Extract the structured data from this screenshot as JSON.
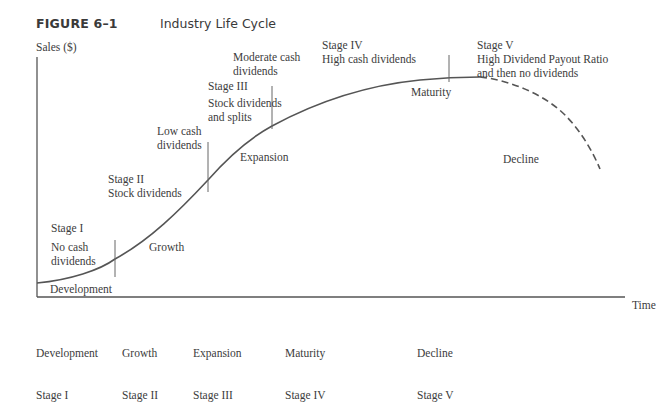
{
  "figure": {
    "number": "FIGURE 6–1",
    "title": "Industry Life Cycle"
  },
  "axes": {
    "y_label": "Sales ($)",
    "x_label": "Time"
  },
  "annotations": {
    "stage1": {
      "heading": "Stage I",
      "text": "No cash\ndividends"
    },
    "stage2": {
      "text": "Stage II\nStock dividends"
    },
    "low_cash": {
      "text": "Low cash\ndividends"
    },
    "stage3": {
      "heading": "Stage III",
      "text": "Stock dividends\nand splits"
    },
    "moderate_cash": {
      "text": "Moderate cash\ndividends"
    },
    "stage4": {
      "text": "Stage IV\nHigh cash dividends"
    },
    "stage5": {
      "text": "Stage V\nHigh Dividend Payout Ratio\nand then no dividends"
    }
  },
  "phase_labels": {
    "development": "Development",
    "growth": "Growth",
    "expansion": "Expansion",
    "maturity": "Maturity",
    "decline": "Decline"
  },
  "bottom_labels": [
    {
      "phase": "Development",
      "stage": "Stage I"
    },
    {
      "phase": "Growth",
      "stage": "Stage II"
    },
    {
      "phase": "Expansion",
      "stage": "Stage III"
    },
    {
      "phase": "Maturity",
      "stage": "Stage IV"
    },
    {
      "phase": "Decline",
      "stage": "Stage V"
    }
  ],
  "colors": {
    "line": "#555555",
    "text": "#3c3c3c"
  }
}
